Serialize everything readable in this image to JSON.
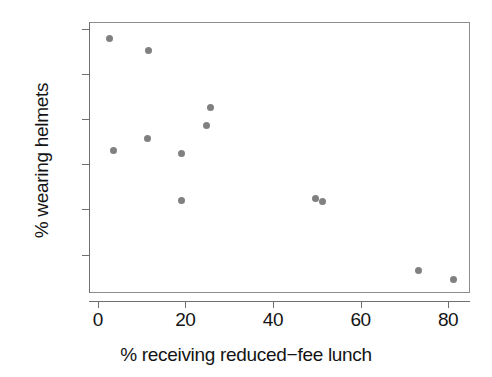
{
  "chart_data": {
    "type": "scatter",
    "title": "",
    "xlabel": "% receiving reduced−fee lunch",
    "ylabel": "% wearing helmets",
    "xlim": [
      -2,
      85
    ],
    "ylim": [
      1.5,
      61.5
    ],
    "xticks": [
      0,
      20,
      40,
      60,
      80
    ],
    "xtick_labels": [
      "0",
      "20",
      "40",
      "60",
      "80"
    ],
    "yticks": [
      10,
      20,
      30,
      40,
      50,
      60
    ],
    "ytick_labels": [
      "10",
      "20",
      "30",
      "40",
      "50",
      "60"
    ],
    "grid": false,
    "legend": null,
    "marker_color": "#808080",
    "frame_color": "#8d8d8d",
    "points": [
      {
        "x": 2.5,
        "y": 58.0
      },
      {
        "x": 3.3,
        "y": 33.3
      },
      {
        "x": 11.3,
        "y": 55.4
      },
      {
        "x": 11.1,
        "y": 36.0
      },
      {
        "x": 19.0,
        "y": 32.7
      },
      {
        "x": 19.0,
        "y": 22.3
      },
      {
        "x": 24.5,
        "y": 38.8
      },
      {
        "x": 25.6,
        "y": 42.8
      },
      {
        "x": 49.5,
        "y": 22.6
      },
      {
        "x": 51.0,
        "y": 22.0
      },
      {
        "x": 73.0,
        "y": 6.8
      },
      {
        "x": 81.0,
        "y": 4.6
      }
    ]
  }
}
